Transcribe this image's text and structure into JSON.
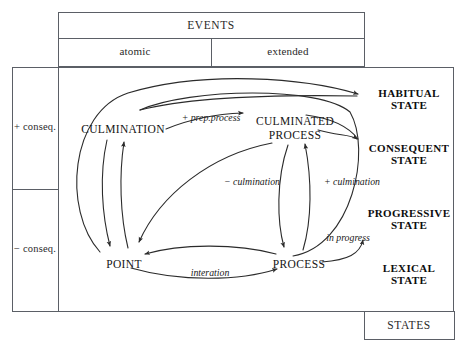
{
  "diagram": {
    "title_box": {
      "label": "EVENTS"
    },
    "event_subtypes": [
      {
        "label": "atomic"
      },
      {
        "label": "extended"
      }
    ],
    "states_box": {
      "label": "STATES"
    },
    "consequence_axis": [
      {
        "label": "+ conseq."
      },
      {
        "label": "− conseq."
      }
    ],
    "nodes": [
      {
        "id": "culmination",
        "label": "CULMINATION"
      },
      {
        "id": "culminated_process_line1",
        "label": "CULMINATED"
      },
      {
        "id": "culminated_process_line2",
        "label": "PROCESS"
      },
      {
        "id": "point",
        "label": "POINT"
      },
      {
        "id": "process",
        "label": "PROCESS"
      }
    ],
    "states": [
      {
        "id": "habitual",
        "line1": "HABITUAL",
        "line2": "STATE"
      },
      {
        "id": "consequent",
        "line1": "CONSEQUENT",
        "line2": "STATE"
      },
      {
        "id": "progressive",
        "line1": "PROGRESSIVE",
        "line2": "STATE"
      },
      {
        "id": "lexical",
        "line1": "LEXICAL",
        "line2": "STATE"
      }
    ],
    "edge_labels": [
      {
        "id": "prep_process",
        "label": "+ prep.process"
      },
      {
        "id": "minus_culmination",
        "label": "− culmination"
      },
      {
        "id": "plus_culmination",
        "label": "+ culmination"
      },
      {
        "id": "in_progress",
        "label": "in progress"
      },
      {
        "id": "interation",
        "label": "interation"
      }
    ],
    "colors": {
      "stroke": "#2b2b2b",
      "frame": "#5b5f66",
      "text": "#141414",
      "background": "#ffffff"
    }
  }
}
